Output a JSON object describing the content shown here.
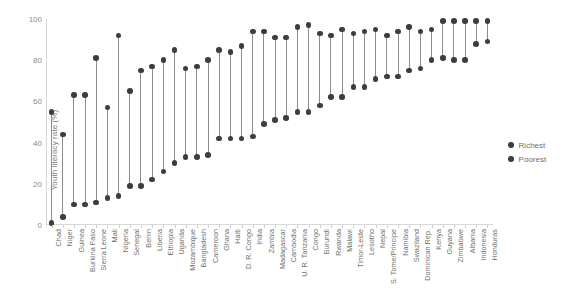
{
  "chart_data": {
    "type": "scatter",
    "subtype": "dumbbell-range-plot",
    "title": "",
    "xlabel": "",
    "ylabel": "Youth literacy rate (%)",
    "ylim": [
      0,
      100
    ],
    "yticks": [
      0,
      20,
      40,
      60,
      80,
      100
    ],
    "ytick_labels": [
      "0",
      "20",
      "40",
      "60",
      "80",
      "100"
    ],
    "grid": false,
    "legend_position": "right",
    "marker_color": "#3d3d3d",
    "connector_color": "#8d8d8d",
    "axis_color": "#d8d8d8",
    "categories": [
      "Chad",
      "Niger",
      "Guinea",
      "Burkina Faso",
      "Sierra Leone",
      "Mali",
      "Nigeria",
      "Senegal",
      "Benin",
      "Liberia",
      "Ethiopia",
      "Uganda",
      "Mozambique",
      "Bangladesh",
      "Cameroon",
      "Ghana",
      "Haiti",
      "D. R. Congo",
      "India",
      "Zambia",
      "Madagascar",
      "Cambodia",
      "U. R. Tanzania",
      "Congo",
      "Burundi",
      "Rwanda",
      "Malawi",
      "Timor-Leste",
      "Lesotho",
      "Nepal",
      "S. Tome/Principe",
      "Namibia",
      "Swaziland",
      "Dominican Rep.",
      "Kenya",
      "Guyana",
      "Zimbabwe",
      "Albania",
      "Indonesia",
      "Honduras"
    ],
    "series": [
      {
        "name": "Richest",
        "color": "#3d3d3d",
        "values": [
          55,
          44,
          63,
          63,
          81,
          57,
          92,
          65,
          75,
          77,
          80,
          85,
          76,
          77,
          80,
          85,
          84,
          87,
          94,
          94,
          91,
          91,
          96,
          97,
          93,
          92,
          95,
          93,
          94,
          95,
          92,
          94,
          96,
          94,
          95,
          99,
          99,
          99,
          99,
          99
        ]
      },
      {
        "name": "Poorest",
        "color": "#3d3d3d",
        "values": [
          1,
          4,
          10,
          10,
          11,
          13,
          14,
          19,
          19,
          22,
          26,
          30,
          33,
          33,
          34,
          42,
          42,
          42,
          43,
          49,
          51,
          52,
          55,
          55,
          58,
          62,
          62,
          67,
          67,
          71,
          72,
          72,
          75,
          76,
          80,
          81,
          80,
          80,
          88,
          89
        ]
      }
    ]
  },
  "legend": {
    "items": [
      {
        "label": "Richest"
      },
      {
        "label": "Poorest"
      }
    ]
  }
}
